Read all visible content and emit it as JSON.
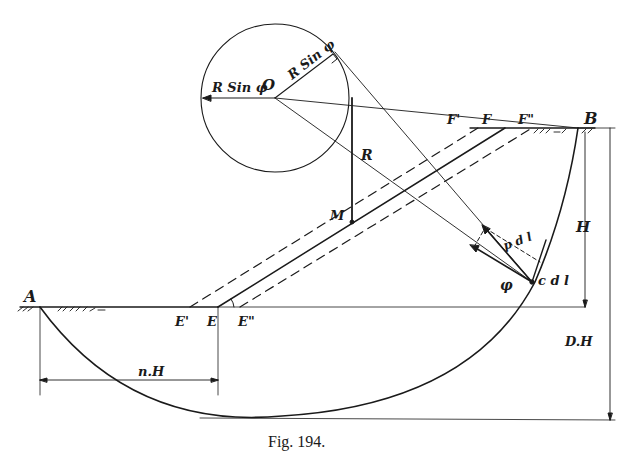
{
  "figure": {
    "caption": "Fig. 194.",
    "labels": {
      "A": "A",
      "B": "B",
      "O": "O",
      "M": "M",
      "R": "R",
      "E": "E",
      "E_prime": "E'",
      "E_double_prime": "E\"",
      "F": "F",
      "F_prime": "F'",
      "F_double_prime": "F\"",
      "H": "H",
      "DH": "D.H",
      "nH": "n.H",
      "R_sin_phi_left": "R Sin φ",
      "R_sin_phi_top": "R Sin φ",
      "phi": "φ",
      "p_dl": "p d l",
      "c_dl": "c d l"
    }
  }
}
